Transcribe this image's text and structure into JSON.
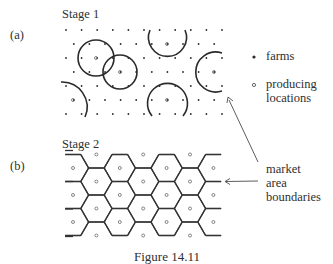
{
  "figure": {
    "caption": "Figure 14.11",
    "panels": [
      {
        "id": "a",
        "tag": "(a)",
        "title": "Stage 1"
      },
      {
        "id": "b",
        "tag": "(b)",
        "title": "Stage 2"
      }
    ],
    "legend": [
      {
        "symbol": "filled-dot",
        "label": "farms"
      },
      {
        "symbol": "hollow-dot",
        "label_line1": "producing",
        "label_line2": "locations"
      }
    ],
    "annotation": {
      "line1": "market",
      "line2": "area",
      "line3": "boundaries"
    },
    "colors": {
      "ink": "#2a2a2a",
      "background": "#ffffff"
    }
  }
}
